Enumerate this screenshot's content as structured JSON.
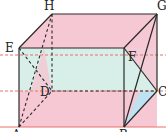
{
  "figure": {
    "type": "geometry-3d-prism",
    "width": 166,
    "height": 132,
    "vertices": {
      "H": {
        "label": "H",
        "x": 52,
        "y": 14,
        "lx": 44,
        "ly": 10
      },
      "G": {
        "label": "G",
        "x": 157,
        "y": 14,
        "lx": 158,
        "ly": 10
      },
      "E": {
        "label": "E",
        "x": 19,
        "y": 48,
        "lx": 7,
        "ly": 52
      },
      "F": {
        "label": "F",
        "x": 124,
        "y": 48,
        "lx": 128,
        "ly": 60
      },
      "D": {
        "label": "D",
        "x": 52,
        "y": 91,
        "lx": 41,
        "ly": 96
      },
      "C": {
        "label": "C",
        "x": 157,
        "y": 91,
        "lx": 158,
        "ly": 95
      },
      "A": {
        "label": "A",
        "x": 19,
        "y": 127,
        "lx": 12,
        "ly": 136
      },
      "B": {
        "label": "B",
        "x": 124,
        "y": 127,
        "lx": 120,
        "ly": 136
      }
    },
    "colors": {
      "pink": "#f5c8d4",
      "teal": "#d8eee8",
      "blue": "#bfe2f2",
      "edge": "#2a2a2a",
      "red_line": "#e8706f"
    },
    "red_lines_y": [
      55,
      91,
      127
    ]
  }
}
